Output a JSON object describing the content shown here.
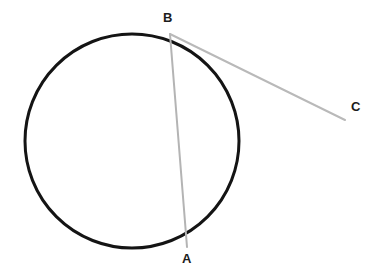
{
  "diagram": {
    "background_color": "#ffffff",
    "width": 382,
    "height": 277,
    "circle": {
      "name": "circle",
      "cx": 132,
      "cy": 141,
      "r": 107,
      "stroke_color": "#141414",
      "stroke_width": 3,
      "fill": "none"
    },
    "segments": [
      {
        "name": "chord-BA",
        "from": "B",
        "to": "A",
        "x1": 170,
        "y1": 34,
        "x2": 187,
        "y2": 247,
        "stroke_color": "#b4b4b4",
        "stroke_width": 2
      },
      {
        "name": "line-BC",
        "from": "B",
        "to": "C",
        "x1": 170,
        "y1": 34,
        "x2": 345,
        "y2": 120,
        "stroke_color": "#b9b9b9",
        "stroke_width": 2
      }
    ],
    "labels": [
      {
        "id": "B",
        "text": "B",
        "x": 163,
        "y": 11,
        "color": "#1c1c1c"
      },
      {
        "id": "A",
        "text": "A",
        "x": 182,
        "y": 252,
        "color": "#1c1c1c"
      },
      {
        "id": "C",
        "text": "C",
        "x": 351,
        "y": 100,
        "color": "#1c1c1c"
      }
    ]
  }
}
